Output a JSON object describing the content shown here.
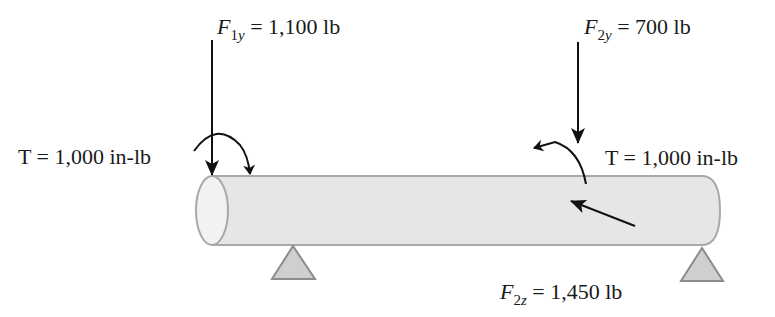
{
  "diagram": {
    "type": "shaft free-body diagram",
    "colors": {
      "shaft_fill": "#e6e6e6",
      "shaft_stroke": "#a8a8a8",
      "shaft_end_fill": "#f2f2f2",
      "support_fill": "#cfcfcf",
      "support_stroke": "#8c8c8c",
      "arrow": "#111111",
      "text": "#1a1a1a"
    },
    "loads": {
      "f1y": {
        "symbol": "F",
        "sub_num": "1",
        "sub_var": "y",
        "value_text": " = 1,100 lb",
        "magnitude": 1100,
        "unit": "lb",
        "direction": "down"
      },
      "f2y": {
        "symbol": "F",
        "sub_num": "2",
        "sub_var": "y",
        "value_text": " = 700 lb",
        "magnitude": 700,
        "unit": "lb",
        "direction": "down"
      },
      "f2z": {
        "symbol": "F",
        "sub_num": "2",
        "sub_var": "z",
        "value_text": " = 1,450 lb",
        "magnitude": 1450,
        "unit": "lb",
        "direction": "into page (z)"
      },
      "torque_left": {
        "text": "T = 1,000 in-lb",
        "magnitude": 1000,
        "unit": "in-lb",
        "direction": "clockwise"
      },
      "torque_right": {
        "text": "T = 1,000 in-lb",
        "magnitude": 1000,
        "unit": "in-lb",
        "direction": "counter-clockwise"
      }
    },
    "supports": [
      {
        "name": "left-support",
        "type": "pin"
      },
      {
        "name": "right-support",
        "type": "pin"
      }
    ]
  }
}
